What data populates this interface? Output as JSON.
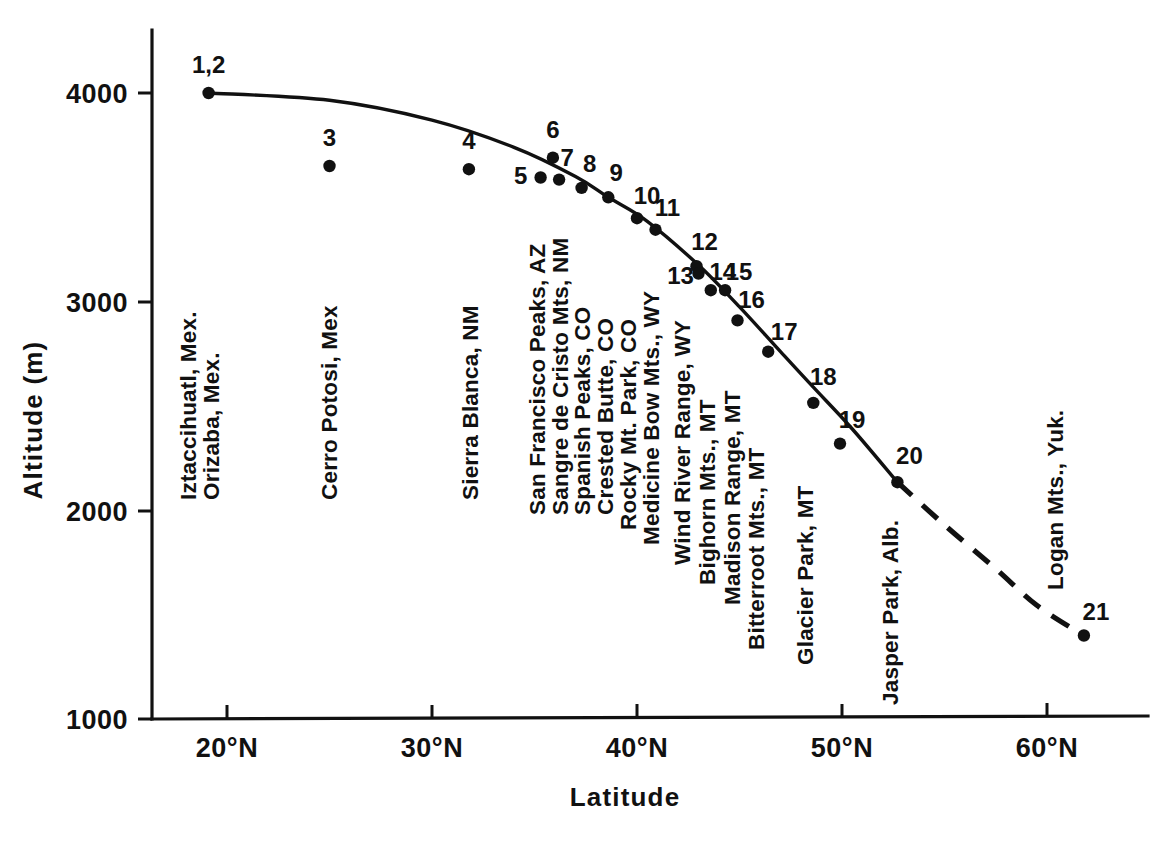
{
  "chart_data": {
    "type": "scatter",
    "title": "",
    "xlabel": "Latitude",
    "ylabel": "Altitude (m)",
    "xlim": [
      17,
      65
    ],
    "ylim": [
      1000,
      4300
    ],
    "grid": false,
    "legend": "none",
    "x_tick_labels": [
      "20°N",
      "30°N",
      "40°N",
      "50°N",
      "60°N"
    ],
    "x_ticks": [
      20,
      30,
      40,
      50,
      60
    ],
    "y_tick_labels": [
      "4000",
      "3000",
      "2000",
      "1000"
    ],
    "y_ticks": [
      4000,
      3000,
      2000,
      1000
    ],
    "points": [
      {
        "id": "1,2",
        "label": "Iztaccihuatl, Mex.",
        "label2": "Orizaba, Mex.",
        "x": 19.1,
        "y": 4000
      },
      {
        "id": "3",
        "label": "Cerro Potosi, Mex",
        "x": 25.0,
        "y": 3650
      },
      {
        "id": "4",
        "label": "Sierra Blanca, NM",
        "x": 31.8,
        "y": 3635
      },
      {
        "id": "5",
        "label": "San Francisco Peaks, AZ",
        "x": 35.3,
        "y": 3595
      },
      {
        "id": "6",
        "label": "",
        "x": 35.9,
        "y": 3690
      },
      {
        "id": "7",
        "label": "Sangre de Cristo Mts, NM",
        "x": 36.2,
        "y": 3585
      },
      {
        "id": "8",
        "label": "Spanish Peaks, CO",
        "x": 37.3,
        "y": 3545
      },
      {
        "id": "9",
        "label": "Crested Butte, CO",
        "x": 38.6,
        "y": 3500
      },
      {
        "id": "10",
        "label": "Rocky Mt. Park, CO",
        "x": 40.0,
        "y": 3400
      },
      {
        "id": "11",
        "label": "Medicine Bow Mts., WY",
        "x": 40.9,
        "y": 3345
      },
      {
        "id": "12",
        "label": "",
        "x": 42.9,
        "y": 3170
      },
      {
        "id": "13",
        "label": "Wind River Range, WY",
        "x": 43.0,
        "y": 3135
      },
      {
        "id": "14",
        "label": "Bighorn Mts., MT",
        "x": 43.6,
        "y": 3055
      },
      {
        "id": "15",
        "label": "Madison Range, MT",
        "x": 44.3,
        "y": 3055
      },
      {
        "id": "16",
        "label": "Bitterroot Mts., MT",
        "x": 44.9,
        "y": 2910
      },
      {
        "id": "17",
        "label": "Glacier Park, MT",
        "x": 46.4,
        "y": 2760
      },
      {
        "id": "18",
        "label": "Jasper Park, Alb.",
        "x": 48.6,
        "y": 2515
      },
      {
        "id": "19",
        "label": "",
        "x": 49.9,
        "y": 2320
      },
      {
        "id": "20",
        "label": "",
        "x": 52.7,
        "y": 2135
      },
      {
        "id": "21",
        "label": "Logan Mts., Yuk.",
        "x": 61.8,
        "y": 1400
      }
    ],
    "trend_curve": {
      "style_solid_range": [
        19.1,
        52.7
      ],
      "style_dashed_range": [
        52.7,
        61.8
      ],
      "description": "Fitted treeline decline curve, solid through observed range, dashed extrapolation to Logan Mts."
    },
    "site_labels": [
      {
        "text": "Iztaccihuatl, Mex.",
        "x": 196,
        "y_bottom": 500
      },
      {
        "text": "Orizaba, Mex.",
        "x": 219,
        "y_bottom": 500
      },
      {
        "text": "Cerro Potosi, Mex",
        "x": 337,
        "y_bottom": 500
      },
      {
        "text": "Sierra Blanca, NM",
        "x": 478,
        "y_bottom": 500
      },
      {
        "text": "San Francisco Peaks, AZ",
        "x": 545,
        "y_bottom": 515
      },
      {
        "text": "Sangre de Cristo Mts, NM",
        "x": 568,
        "y_bottom": 515
      },
      {
        "text": "Spanish Peaks, CO",
        "x": 590,
        "y_bottom": 515
      },
      {
        "text": "Crested Butte, CO",
        "x": 613,
        "y_bottom": 515
      },
      {
        "text": "Rocky Mt. Park, CO",
        "x": 636,
        "y_bottom": 530
      },
      {
        "text": "Medicine Bow Mts., WY",
        "x": 659,
        "y_bottom": 545
      },
      {
        "text": "Wind River Range, WY",
        "x": 690,
        "y_bottom": 565
      },
      {
        "text": "Bighorn Mts., MT",
        "x": 715,
        "y_bottom": 585
      },
      {
        "text": "Madison Range, MT",
        "x": 740,
        "y_bottom": 605
      },
      {
        "text": "Bitterroot Mts., MT",
        "x": 764,
        "y_bottom": 650
      },
      {
        "text": "Glacier Park, MT",
        "x": 813,
        "y_bottom": 665
      },
      {
        "text": "Jasper Park, Alb.",
        "x": 898,
        "y_bottom": 705
      },
      {
        "text": "Logan Mts., Yuk.",
        "x": 1063,
        "y_bottom": 590
      }
    ]
  },
  "axes": {
    "y_title": "Altitude (m)",
    "x_title": "Latitude"
  }
}
